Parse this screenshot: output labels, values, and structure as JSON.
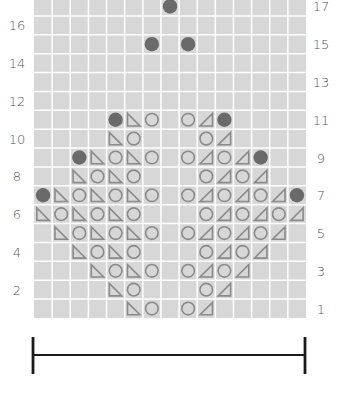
{
  "chart_title": "Knitting lace chart",
  "grid": {
    "columns": 15,
    "rows": 17,
    "left": 34,
    "right": 306,
    "top": -3,
    "bottom": 318,
    "cell_color": "#d7d7d7",
    "line_color": "#ffffff",
    "symbol_color": "#8a8a8a",
    "dot_color": "#6a6a6a"
  },
  "legend_symbols": {
    "dot": "bobble / filled circle",
    "lt": "left-slant triangle",
    "rt": "right-slant triangle",
    "o": "open circle (yarn over)"
  },
  "row_labels_left": [
    "16",
    "14",
    "12",
    "10",
    "8",
    "6",
    "4",
    "2"
  ],
  "row_labels_right": [
    "17",
    "15",
    "13",
    "11",
    "9",
    "7",
    "5",
    "3",
    "1"
  ],
  "cells": {
    "17": {
      "8": "dot"
    },
    "16": {},
    "15": {
      "7": "dot",
      "9": "dot"
    },
    "14": {},
    "13": {},
    "12": {},
    "11": {
      "5": "dot",
      "6": "lt",
      "7": "o",
      "9": "o",
      "10": "rt",
      "11": "dot"
    },
    "10": {
      "5": "lt",
      "6": "o",
      "10": "o",
      "11": "rt"
    },
    "9": {
      "3": "dot",
      "4": "lt",
      "5": "o",
      "6": "lt",
      "7": "o",
      "9": "o",
      "10": "rt",
      "11": "o",
      "12": "rt",
      "13": "dot"
    },
    "8": {
      "3": "lt",
      "4": "o",
      "5": "lt",
      "6": "o",
      "10": "o",
      "11": "rt",
      "12": "o",
      "13": "rt"
    },
    "7": {
      "1": "dot",
      "2": "lt",
      "3": "o",
      "4": "lt",
      "5": "o",
      "6": "lt",
      "7": "o",
      "9": "o",
      "10": "rt",
      "11": "o",
      "12": "rt",
      "13": "o",
      "14": "rt",
      "15": "dot"
    },
    "6": {
      "1": "lt",
      "2": "o",
      "3": "lt",
      "4": "o",
      "5": "lt",
      "6": "o",
      "10": "o",
      "11": "rt",
      "12": "o",
      "13": "rt",
      "14": "o",
      "15": "rt"
    },
    "5": {
      "2": "lt",
      "3": "o",
      "4": "lt",
      "5": "o",
      "6": "lt",
      "7": "o",
      "9": "o",
      "10": "rt",
      "11": "o",
      "12": "rt",
      "13": "o",
      "14": "rt"
    },
    "4": {
      "3": "lt",
      "4": "o",
      "5": "lt",
      "6": "o",
      "10": "o",
      "11": "rt",
      "12": "o",
      "13": "rt"
    },
    "3": {
      "4": "lt",
      "5": "o",
      "6": "lt",
      "7": "o",
      "9": "o",
      "10": "rt",
      "11": "o",
      "12": "rt"
    },
    "2": {
      "5": "lt",
      "6": "o",
      "10": "o",
      "11": "rt"
    },
    "1": {
      "6": "lt",
      "7": "o",
      "9": "o",
      "10": "rt"
    }
  },
  "width_bar": {
    "x1": 33,
    "x2": 305,
    "y": 355,
    "tick_top": 337,
    "tick_bottom": 374,
    "color": "#1a1a1a"
  }
}
